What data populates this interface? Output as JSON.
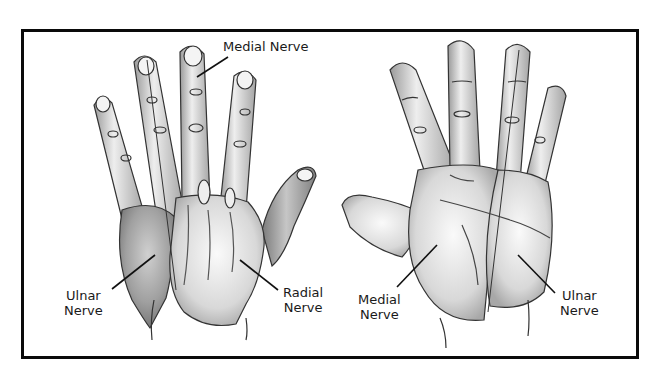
{
  "figure": {
    "colors": {
      "frame": "#0a0a0a",
      "background": "#ffffff",
      "skin_light": "#f2f2f2",
      "skin_mid": "#bdbdbd",
      "skin_dark": "#8a8a8a",
      "outline": "#333333"
    }
  },
  "dorsal_hand": {
    "labels": {
      "medial": {
        "line1": "Medial Nerve"
      },
      "ulnar": {
        "line1": "Ulnar",
        "line2": "Nerve"
      },
      "radial": {
        "line1": "Radial",
        "line2": "Nerve"
      }
    }
  },
  "palmar_hand": {
    "labels": {
      "medial": {
        "line1": "Medial",
        "line2": "Nerve"
      },
      "ulnar": {
        "line1": "Ulnar",
        "line2": "Nerve"
      }
    }
  }
}
